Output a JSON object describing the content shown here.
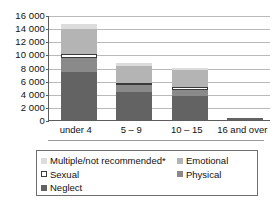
{
  "chart_data": {
    "type": "bar",
    "stacked": true,
    "title": "",
    "xlabel": "",
    "ylabel": "",
    "ylim": [
      0,
      16000
    ],
    "ytick_step": 2000,
    "ytick_labels": [
      "16 000",
      "14 000",
      "12 000",
      "10 000",
      "8 000",
      "6 000",
      "4 000",
      "2 000",
      "0"
    ],
    "ytick_values": [
      16000,
      14000,
      12000,
      10000,
      8000,
      6000,
      4000,
      2000,
      0
    ],
    "grid": true,
    "legend_position": "below",
    "categories": [
      "under 4",
      "5 – 9",
      "10 – 15",
      "16 and over"
    ],
    "series": [
      {
        "name": "Neglect",
        "color": "#636363",
        "values": [
          7300,
          4300,
          3700,
          350
        ]
      },
      {
        "name": "Physical",
        "color": "#8a8a8a",
        "values": [
          2200,
          1000,
          900,
          0
        ]
      },
      {
        "name": "Sexual",
        "color": "#ffffff",
        "values": [
          500,
          400,
          500,
          0
        ]
      },
      {
        "name": "Emotional",
        "color": "#b4b4b4",
        "values": [
          3900,
          2500,
          2500,
          0
        ]
      },
      {
        "name": "Multiple/not recommended*",
        "color": "#dcdcdc",
        "values": [
          700,
          500,
          400,
          0
        ]
      }
    ],
    "totals": [
      14600,
      8700,
      8000,
      350
    ]
  },
  "legend": {
    "left_items": [
      {
        "label": "Multiple/not recommended*",
        "swatch": "multiple"
      },
      {
        "label": "Sexual",
        "swatch": "sexual"
      },
      {
        "label": "Neglect",
        "swatch": "neglect"
      }
    ],
    "right_items": [
      {
        "label": "Emotional",
        "swatch": "emotional"
      },
      {
        "label": "Physical",
        "swatch": "physical"
      }
    ]
  }
}
